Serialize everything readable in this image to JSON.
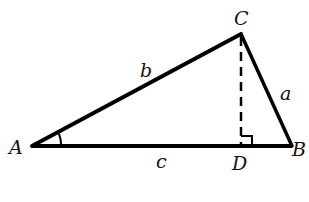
{
  "diagram": {
    "vertices": {
      "A": {
        "label": "A",
        "x": 32,
        "y": 146
      },
      "B": {
        "label": "B",
        "x": 292,
        "y": 146
      },
      "C": {
        "label": "C",
        "x": 241,
        "y": 34
      },
      "D": {
        "label": "D",
        "x": 241,
        "y": 146
      }
    },
    "sides": {
      "a": "a",
      "b": "b",
      "c": "c"
    },
    "marks": {
      "angle_A": "angle arc at A",
      "right_angle_D": "right angle at D"
    },
    "colors": {
      "stroke": "#000000",
      "background": "#ffffff"
    }
  }
}
